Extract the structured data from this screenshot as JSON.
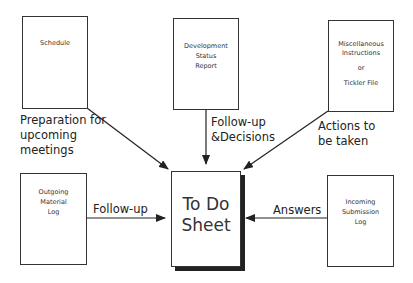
{
  "diagram": {
    "center": {
      "lines": [
        "To Do",
        "Sheet"
      ]
    },
    "sources": [
      {
        "id": "schedule",
        "lines": [
          "Schedule"
        ]
      },
      {
        "id": "development-status-report",
        "lines": [
          "Development",
          "Status",
          "Report"
        ]
      },
      {
        "id": "misc-instructions",
        "lines": [
          "Miscellaneous",
          "Instructions",
          "",
          "or",
          "",
          "Tickler File"
        ]
      },
      {
        "id": "outgoing-material-log",
        "lines": [
          "Outgoing",
          "Material",
          "Log"
        ]
      },
      {
        "id": "incoming-submission-log",
        "lines": [
          "Incoming",
          "Submission",
          "Log"
        ]
      }
    ],
    "edges": [
      {
        "from": "schedule",
        "lines": [
          "Preparation for",
          "upcoming",
          "meetings"
        ]
      },
      {
        "from": "development-status-report",
        "lines": [
          "Follow-up",
          "&Decisions"
        ]
      },
      {
        "from": "misc-instructions",
        "lines": [
          "Actions to",
          "be taken"
        ]
      },
      {
        "from": "outgoing-material-log",
        "lines": [
          "Follow-up"
        ]
      },
      {
        "from": "incoming-submission-log",
        "lines": [
          "Answers"
        ]
      }
    ],
    "colors": {
      "stroke": "#222222",
      "background": "#ffffff",
      "shadow": "#222222"
    }
  }
}
